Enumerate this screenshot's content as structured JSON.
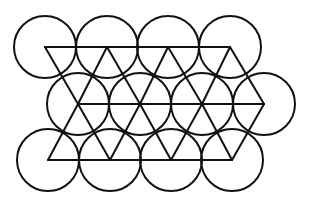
{
  "diagram": {
    "title": "",
    "stroke_color": "#111111",
    "background": "#ffffff",
    "radius": 31,
    "rows": [
      {
        "name": "top",
        "y": 47,
        "xs": [
          45,
          107,
          168,
          230
        ]
      },
      {
        "name": "middle",
        "y": 104,
        "xs": [
          78,
          140,
          202,
          264
        ]
      },
      {
        "name": "bottom",
        "y": 160,
        "xs": [
          48,
          110,
          171,
          232
        ]
      }
    ]
  }
}
